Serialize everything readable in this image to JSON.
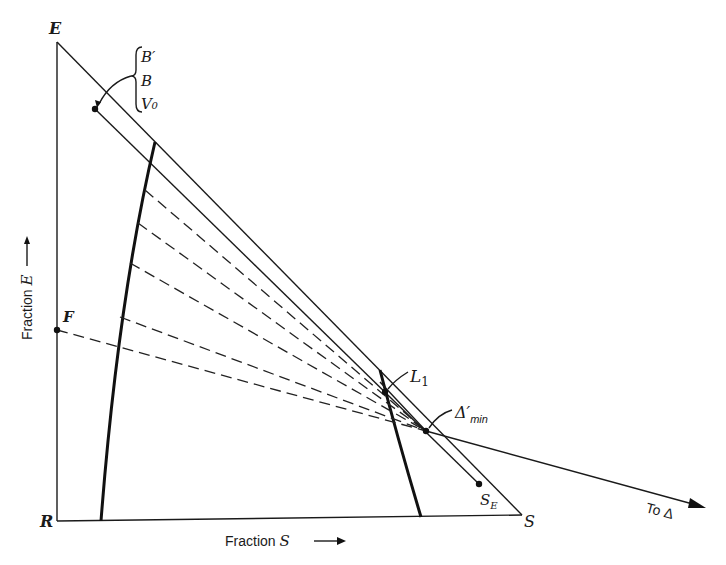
{
  "figure": {
    "type": "ternary-extraction-diagram",
    "vertices": {
      "E": {
        "label": "E",
        "x": 57,
        "y": 42
      },
      "R": {
        "label": "R",
        "x": 57,
        "y": 521
      },
      "S": {
        "label": "S",
        "x": 522,
        "y": 516
      }
    },
    "axis_labels": {
      "vertical": "Fraction E →",
      "vertical_text": "Fraction",
      "vertical_var": "E",
      "horizontal_text": "Fraction",
      "horizontal_var": "S"
    },
    "points": {
      "F": {
        "label": "F",
        "x": 57,
        "y": 330
      },
      "V0": {
        "labels": [
          "B′",
          "B",
          "V₀"
        ],
        "x": 95,
        "y": 109
      },
      "SE": {
        "label": "S",
        "sub": "E",
        "x": 479,
        "y": 484
      },
      "L1": {
        "label": "L",
        "sub": "1",
        "x": 385,
        "y": 392
      },
      "delta_min": {
        "label": "Δ′",
        "sub": "min",
        "x": 426,
        "y": 431
      }
    },
    "arrow_label": "To Δ",
    "curves": {
      "extract_boundary": [
        [
          155,
          142
        ],
        [
          145,
          190
        ],
        [
          138,
          223
        ],
        [
          130,
          263
        ],
        [
          120,
          317
        ],
        [
          115,
          347
        ],
        [
          101,
          521
        ]
      ],
      "raffinate_boundary": [
        [
          380,
          370
        ],
        [
          385,
          392
        ],
        [
          422,
          517
        ]
      ]
    },
    "tie_line_origins": [
      [
        145,
        190
      ],
      [
        138,
        223
      ],
      [
        130,
        263
      ],
      [
        120,
        317
      ],
      [
        115,
        347
      ]
    ]
  }
}
